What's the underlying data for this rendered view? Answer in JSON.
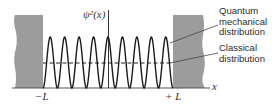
{
  "diagram": {
    "type": "probability-distribution",
    "y_axis_label": "ψ²(x)",
    "x_axis_label": "x",
    "left_bound_label": "−L",
    "right_bound_label": "+ L",
    "annotations": {
      "quantum": [
        "Quantum",
        "mechanical",
        "distribution"
      ],
      "classical": [
        "Classical",
        "distribution"
      ]
    },
    "peaks": 9,
    "colors": {
      "wall": "#9a9a9a",
      "curve": "#1a1a1a",
      "axis": "#333333",
      "text": "#2b2b2b"
    }
  }
}
